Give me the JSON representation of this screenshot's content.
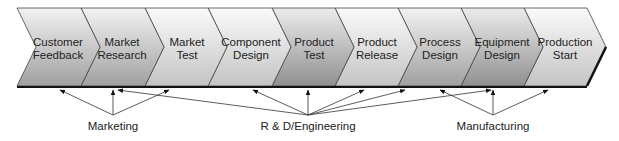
{
  "stages": [
    {
      "line1": "Customer",
      "line2": "Feedback"
    },
    {
      "line1": "Market",
      "line2": "Research"
    },
    {
      "line1": "Market",
      "line2": "Test"
    },
    {
      "line1": "Component",
      "line2": "Design"
    },
    {
      "line1": "Product",
      "line2": "Test"
    },
    {
      "line1": "Product",
      "line2": "Release"
    },
    {
      "line1": "Process",
      "line2": "Design"
    },
    {
      "line1": "Equipment",
      "line2": "Design"
    },
    {
      "line1": "Production",
      "line2": "Start"
    }
  ],
  "groups": [
    {
      "label": "Marketing"
    },
    {
      "label": "R & D/Engineering"
    },
    {
      "label": "Manufacturing"
    }
  ],
  "colors": {
    "gradient_light": "#f4f4f4",
    "gradient_dark": "#9a9a9a",
    "outline": "#333333",
    "bar": "#111111"
  }
}
